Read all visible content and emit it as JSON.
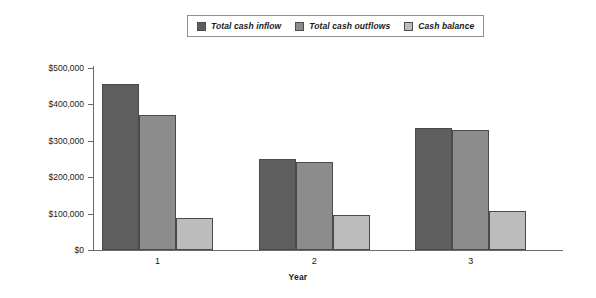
{
  "chart_data": {
    "type": "bar",
    "title": "",
    "xlabel": "Year",
    "ylabel": "",
    "categories": [
      "1",
      "2",
      "3"
    ],
    "series": [
      {
        "name": "Total cash inflow",
        "values": [
          457000,
          251000,
          335000
        ],
        "color": "#5e5e5e"
      },
      {
        "name": "Total cash outflows",
        "values": [
          371000,
          242000,
          329000
        ],
        "color": "#8c8c8c"
      },
      {
        "name": "Cash balance",
        "values": [
          88000,
          97000,
          108000
        ],
        "color": "#bcbcbc"
      }
    ],
    "ylim": [
      0,
      500000
    ],
    "yticks": [
      0,
      100000,
      200000,
      300000,
      400000,
      500000
    ],
    "ytick_labels": [
      "$0",
      "$100,000",
      "$200,000",
      "$300,000",
      "$400,000",
      "$500,000"
    ],
    "xtick_labels": [
      "1",
      "2",
      "3"
    ],
    "grid": false,
    "legend_position": "top-center"
  },
  "legend": {
    "items": [
      {
        "label": "Total cash inflow"
      },
      {
        "label": "Total cash outflows"
      },
      {
        "label": "Cash balance"
      }
    ]
  },
  "axes": {
    "x_title": "Year"
  }
}
